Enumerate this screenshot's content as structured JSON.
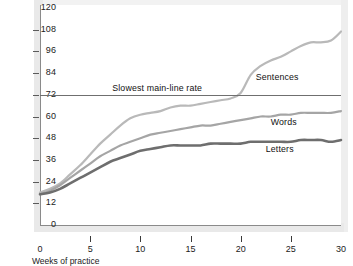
{
  "chart_data": {
    "type": "line",
    "title": "",
    "xlabel": "Weeks of practice",
    "ylabel": "Letters per minute",
    "xlim": [
      0,
      30
    ],
    "ylim": [
      0,
      120
    ],
    "xticks": [
      0,
      5,
      10,
      15,
      20,
      25,
      30
    ],
    "yticks": [
      0,
      12,
      24,
      36,
      48,
      60,
      72,
      84,
      96,
      108,
      120
    ],
    "grid": false,
    "legend_position": "inline-right-of-curves",
    "annotations": [
      {
        "name": "slowest-main-line-rate",
        "text": "Slowest main-line rate",
        "type": "horizontal-reference-line",
        "y": 72,
        "label_x": 7.2,
        "label_y": 76
      }
    ],
    "x": [
      0,
      1,
      2,
      3,
      4,
      5,
      6,
      7,
      8,
      9,
      10,
      11,
      12,
      13,
      14,
      15,
      16,
      17,
      18,
      19,
      20,
      21,
      22,
      23,
      24,
      25,
      26,
      27,
      28,
      29,
      30
    ],
    "series": [
      {
        "name": "Sentences",
        "color": "#b9b9b9",
        "label_x": 21.5,
        "label_y": 82,
        "values": [
          18,
          20,
          23,
          28,
          33,
          39,
          45,
          50,
          55,
          59,
          61,
          62,
          63,
          65,
          66,
          66,
          67,
          68,
          69,
          70,
          73,
          83,
          88,
          91,
          93,
          96,
          99,
          101,
          101,
          102,
          107
        ]
      },
      {
        "name": "Words",
        "color": "#a5a5a5",
        "label_x": 23.0,
        "label_y": 57,
        "values": [
          17,
          19,
          22,
          26,
          30,
          34,
          38,
          41,
          44,
          46,
          48,
          50,
          51,
          52,
          53,
          54,
          55,
          55,
          56,
          57,
          58,
          59,
          60,
          60,
          61,
          61,
          62,
          62,
          62,
          62,
          63
        ]
      },
      {
        "name": "Letters",
        "color": "#6e6e6e",
        "label_x": 22.5,
        "label_y": 42,
        "values": [
          17,
          18,
          20,
          23,
          26,
          29,
          32,
          35,
          37,
          39,
          41,
          42,
          43,
          44,
          44,
          44,
          44,
          45,
          45,
          45,
          45,
          46,
          46,
          46,
          46,
          46,
          47,
          47,
          47,
          46,
          47
        ]
      }
    ]
  }
}
